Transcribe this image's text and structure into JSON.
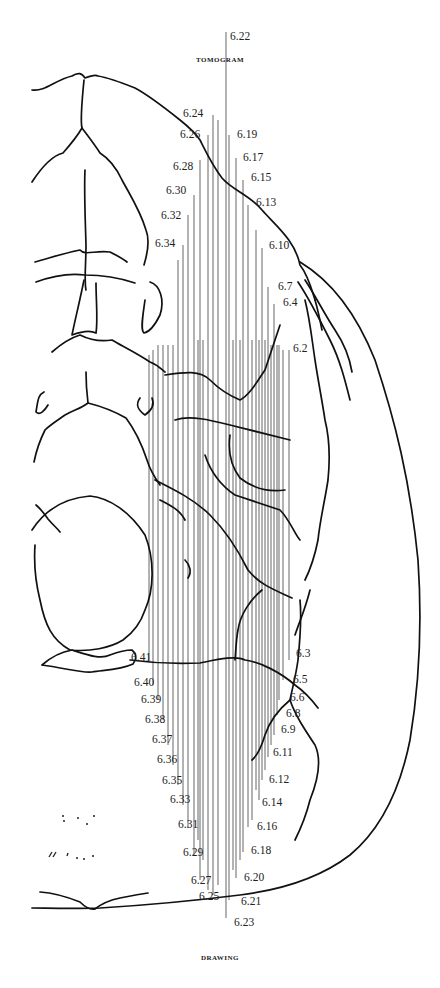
{
  "captions": {
    "top": "Tomogram",
    "bottom": "Drawing"
  },
  "cut_lines": {
    "description": "Vertical tomographic section lines labelled 6.2 – 6.41",
    "top_labels": [
      {
        "label": "6.22",
        "x": 230,
        "y": 40
      },
      {
        "label": "6.24",
        "x": 183,
        "y": 117
      },
      {
        "label": "6.26",
        "x": 180,
        "y": 138
      },
      {
        "label": "6.19",
        "x": 237,
        "y": 138
      },
      {
        "label": "6.28",
        "x": 173,
        "y": 170
      },
      {
        "label": "6.17",
        "x": 243,
        "y": 161
      },
      {
        "label": "6.30",
        "x": 166,
        "y": 194
      },
      {
        "label": "6.15",
        "x": 251,
        "y": 181
      },
      {
        "label": "6.13",
        "x": 256,
        "y": 206
      },
      {
        "label": "6.32",
        "x": 161,
        "y": 219
      },
      {
        "label": "6.34",
        "x": 155,
        "y": 247
      },
      {
        "label": "6.10",
        "x": 269,
        "y": 249
      },
      {
        "label": "6.7",
        "x": 278,
        "y": 290
      },
      {
        "label": "6.4",
        "x": 283,
        "y": 306
      },
      {
        "label": "6.2",
        "x": 293,
        "y": 352
      }
    ],
    "bottom_labels": [
      {
        "label": "6.41",
        "x": 131,
        "y": 661
      },
      {
        "label": "6.3",
        "x": 296,
        "y": 657
      },
      {
        "label": "6.40",
        "x": 134,
        "y": 686
      },
      {
        "label": "6.5",
        "x": 293,
        "y": 683
      },
      {
        "label": "6.39",
        "x": 141,
        "y": 703
      },
      {
        "label": "6.6",
        "x": 290,
        "y": 701
      },
      {
        "label": "6.8",
        "x": 286,
        "y": 717
      },
      {
        "label": "6.38",
        "x": 145,
        "y": 723
      },
      {
        "label": "6.9",
        "x": 281,
        "y": 733
      },
      {
        "label": "6.37",
        "x": 152,
        "y": 743
      },
      {
        "label": "6.11",
        "x": 273,
        "y": 756
      },
      {
        "label": "6.36",
        "x": 157,
        "y": 763
      },
      {
        "label": "6.12",
        "x": 269,
        "y": 783
      },
      {
        "label": "6.35",
        "x": 162,
        "y": 784
      },
      {
        "label": "6.33",
        "x": 170,
        "y": 803
      },
      {
        "label": "6.14",
        "x": 262,
        "y": 806
      },
      {
        "label": "6.31",
        "x": 178,
        "y": 828
      },
      {
        "label": "6.16",
        "x": 257,
        "y": 830
      },
      {
        "label": "6.29",
        "x": 183,
        "y": 856
      },
      {
        "label": "6.18",
        "x": 251,
        "y": 854
      },
      {
        "label": "6.27",
        "x": 191,
        "y": 884
      },
      {
        "label": "6.20",
        "x": 244,
        "y": 881
      },
      {
        "label": "6.25",
        "x": 199,
        "y": 900
      },
      {
        "label": "6.21",
        "x": 241,
        "y": 905
      },
      {
        "label": "6.23",
        "x": 234,
        "y": 926
      }
    ]
  }
}
